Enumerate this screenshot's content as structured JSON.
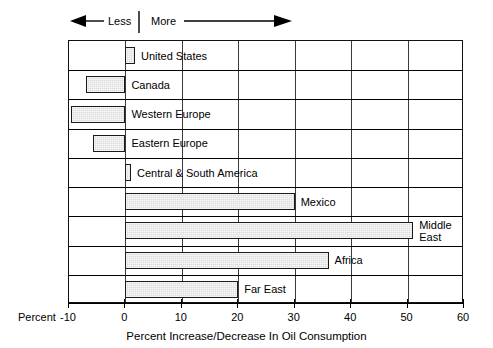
{
  "direction_indicator": {
    "less_label": "Less",
    "more_label": "More",
    "left_arrow_icon": "arrow-left-icon",
    "right_arrow_icon": "arrow-right-icon",
    "divider_icon": "vertical-divider-icon"
  },
  "axis": {
    "percent_word": "Percent",
    "xlabel": "Percent Increase/Decrease In Oil Consumption",
    "tick_labels": [
      "-10",
      "0",
      "10",
      "20",
      "30",
      "40",
      "50",
      "60"
    ]
  },
  "chart_data": {
    "type": "bar",
    "orientation": "horizontal",
    "title": "",
    "subtitle": "",
    "xlabel": "Percent Increase/Decrease In Oil Consumption",
    "ylabel": "",
    "xlim": [
      -10,
      60
    ],
    "xticks": [
      -10,
      0,
      10,
      20,
      30,
      40,
      50,
      60
    ],
    "grid": true,
    "grid_axis": "x",
    "legend": false,
    "zero_reference": 0,
    "annotations": [
      "Less",
      "More"
    ],
    "bar_color": "#dcdcdc",
    "bar_edge_color": "#1a1a1a",
    "categories": [
      "United States",
      "Canada",
      "Western Europe",
      "Eastern Europe",
      "Central & South America",
      "Mexico",
      "Middle East",
      "Africa",
      "Far East"
    ],
    "values": [
      1.7,
      -7,
      -9.7,
      -5.8,
      1,
      30,
      51,
      36,
      20
    ],
    "labels": [
      "United States",
      "Canada",
      "Western Europe",
      "Eastern Europe",
      "Central & South America",
      "Mexico",
      "Middle\nEast",
      "Africa",
      "Far East"
    ]
  }
}
